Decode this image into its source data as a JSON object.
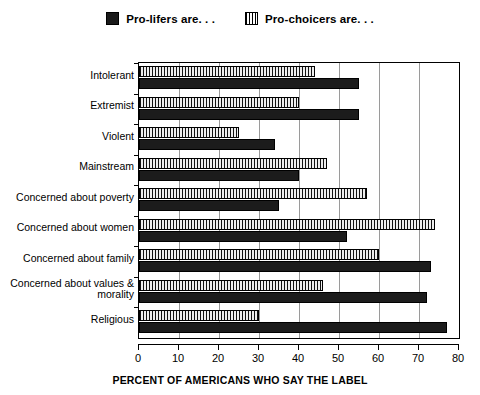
{
  "legend": {
    "entries": [
      {
        "label": "Pro-lifers are. . .",
        "swatch": "dark-solid-swatch",
        "color": "#1c1c1c"
      },
      {
        "label": "Pro-choicers are. . .",
        "swatch": "vertical-hatch-swatch",
        "color": "#d8d8d8"
      }
    ]
  },
  "axis": {
    "x_title": "PERCENT OF AMERICANS WHO SAY THE LABEL",
    "x_ticks": [
      "0",
      "10",
      "20",
      "30",
      "40",
      "50",
      "60",
      "70",
      "80"
    ]
  },
  "chart_data": {
    "type": "bar",
    "orientation": "horizontal",
    "title": "",
    "subtitle": "",
    "xlabel": "PERCENT OF AMERICANS WHO SAY THE LABEL",
    "ylabel": "",
    "xlim": [
      0,
      80
    ],
    "xticks": [
      0,
      10,
      20,
      30,
      40,
      50,
      60,
      70,
      80
    ],
    "grid": true,
    "grid_axis": "x",
    "legend_position": "top-center",
    "categories": [
      "Intolerant",
      "Extremist",
      "Violent",
      "Mainstream",
      "Concerned about poverty",
      "Concerned about women",
      "Concerned about family",
      "Concerned about values & morality",
      "Religious"
    ],
    "series": [
      {
        "name": "Pro-lifers are. . .",
        "color": "#1c1c1c",
        "pattern": "solid",
        "values": [
          55,
          55,
          34,
          40,
          35,
          52,
          73,
          72,
          77
        ]
      },
      {
        "name": "Pro-choicers are. . .",
        "color": "#d8d8d8",
        "pattern": "vertical-hatch",
        "values": [
          44,
          40,
          25,
          47,
          57,
          74,
          60,
          46,
          30
        ]
      }
    ]
  }
}
